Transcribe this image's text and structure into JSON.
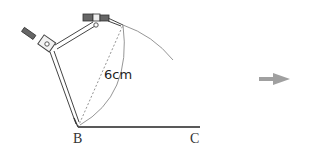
{
  "diagram": {
    "type": "geometry-construction",
    "points": {
      "B": {
        "label": "B",
        "x": 78,
        "y": 127
      },
      "C": {
        "label": "C",
        "x": 195,
        "y": 127
      }
    },
    "measurement": {
      "label": "6cm"
    },
    "arrow": {
      "direction": "right",
      "color": "#a0a0a0"
    },
    "colors": {
      "line": "#222222",
      "arc": "#888888",
      "dashed": "#777777",
      "compass_body": "#555555",
      "compass_handle": "#666666"
    }
  }
}
